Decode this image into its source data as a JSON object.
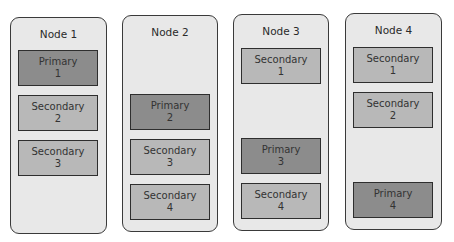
{
  "colors": {
    "primary": "#8c8c8c",
    "secondary": "#b8b8b8",
    "node_bg": "#e8e8e8",
    "border": "#2e2e2e"
  },
  "nodes": [
    {
      "title": "Node 1",
      "replicas": [
        {
          "role": "Primary",
          "id": "1"
        },
        {
          "role": "Secondary",
          "id": "2"
        },
        {
          "role": "Secondary",
          "id": "3"
        }
      ]
    },
    {
      "title": "Node 2",
      "replicas": [
        {
          "role": "Primary",
          "id": "2"
        },
        {
          "role": "Secondary",
          "id": "3"
        },
        {
          "role": "Secondary",
          "id": "4"
        }
      ]
    },
    {
      "title": "Node 3",
      "replicas": [
        {
          "role": "Secondary",
          "id": "1"
        },
        {
          "role": "Primary",
          "id": "3"
        },
        {
          "role": "Secondary",
          "id": "4"
        }
      ]
    },
    {
      "title": "Node 4",
      "replicas": [
        {
          "role": "Secondary",
          "id": "1"
        },
        {
          "role": "Secondary",
          "id": "2"
        },
        {
          "role": "Primary",
          "id": "4"
        }
      ]
    }
  ]
}
